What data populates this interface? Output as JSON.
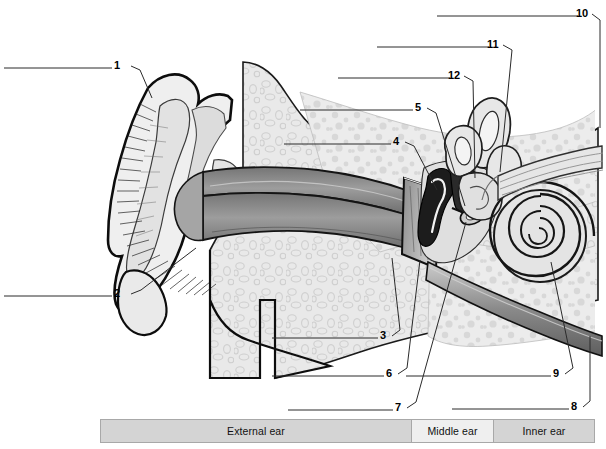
{
  "figure": {
    "type": "labeled-anatomy-diagram",
    "background_color": "#ffffff",
    "line_color": "#000000"
  },
  "callouts": [
    {
      "id": "1",
      "label": "1",
      "x": 118,
      "y": 58,
      "leader": "left-horizontal-then-down-right",
      "points_to": "helix / upper auricle"
    },
    {
      "id": "2",
      "label": "2",
      "x": 118,
      "y": 288,
      "leader": "left-horizontal-then-up-right",
      "points_to": "lobule / earlobe"
    },
    {
      "id": "3",
      "label": "3",
      "x": 384,
      "y": 332,
      "leader": "left-horizontal-then-up-right",
      "points_to": "mastoid / temporal bone"
    },
    {
      "id": "4",
      "label": "4",
      "x": 397,
      "y": 139,
      "leader": "left-horizontal-then-down-right",
      "points_to": "malleus"
    },
    {
      "id": "5",
      "label": "5",
      "x": 419,
      "y": 104,
      "leader": "left-horizontal-then-down-right",
      "points_to": "incus"
    },
    {
      "id": "6",
      "label": "6",
      "x": 390,
      "y": 370,
      "leader": "left-horizontal-then-up-right",
      "points_to": "tympanic membrane"
    },
    {
      "id": "7",
      "label": "7",
      "x": 399,
      "y": 404,
      "leader": "left-horizontal-then-up-right",
      "points_to": "stapes / oval window"
    },
    {
      "id": "8",
      "label": "8",
      "x": 575,
      "y": 403,
      "leader": "left-horizontal-then-up-right",
      "points_to": "eustachian tube"
    },
    {
      "id": "9",
      "label": "9",
      "x": 557,
      "y": 370,
      "leader": "left-horizontal-then-up-right",
      "points_to": "cochlea"
    },
    {
      "id": "10",
      "label": "10",
      "x": 584,
      "y": 10,
      "leader": "left-horizontal-then-down-right",
      "points_to": "semicircular canals"
    },
    {
      "id": "11",
      "label": "11",
      "x": 495,
      "y": 41,
      "leader": "left-horizontal-then-down-right",
      "points_to": "vestibular nerve"
    },
    {
      "id": "12",
      "label": "12",
      "x": 456,
      "y": 72,
      "leader": "left-horizontal-then-down-right",
      "points_to": "vestibule"
    }
  ],
  "legend": {
    "cells": [
      {
        "label": "External ear",
        "region": "external"
      },
      {
        "label": "Middle ear",
        "region": "middle"
      },
      {
        "label": "Inner ear",
        "region": "inner"
      }
    ],
    "border_color": "#a8a8a8",
    "fill_dark": "#d4d4d4",
    "fill_light": "#efefef"
  }
}
